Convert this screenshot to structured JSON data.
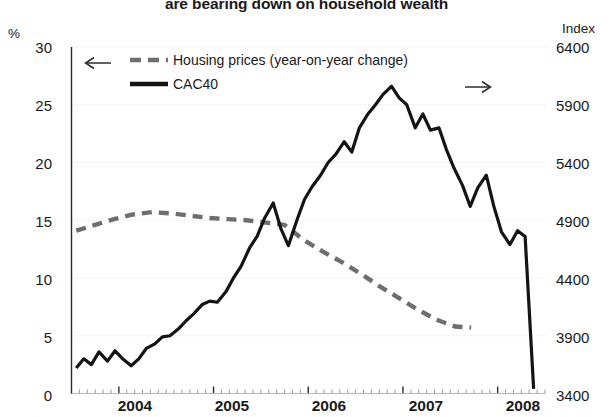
{
  "title": "are bearing down on household wealth",
  "axes": {
    "left_unit": "%",
    "right_unit": "Index",
    "left_ticks": [
      "30",
      "25",
      "20",
      "15",
      "10",
      "5",
      "0"
    ],
    "right_ticks": [
      "6400",
      "5900",
      "5400",
      "4900",
      "4400",
      "3900",
      "3400"
    ],
    "x_ticks": [
      "2004",
      "2005",
      "2006",
      "2007",
      "2008"
    ]
  },
  "legend": {
    "housing_label": "Housing prices (year-on-year change)",
    "housing_arrow": "left-arrow",
    "cac_label": "CAC40",
    "cac_arrow": "right-arrow"
  },
  "colors": {
    "housing": "#6e6e6e",
    "cac40": "#141414",
    "grid": "#e8e8e8",
    "axis": "#2b2b2b",
    "text": "#1a1a1a"
  },
  "chart_data": {
    "type": "line",
    "title": "are bearing down on household wealth",
    "xlabel": "",
    "ylabel": "%",
    "y2label": "Index",
    "ylim": [
      0,
      30
    ],
    "y2lim": [
      3400,
      6400
    ],
    "xlim": [
      2003.5,
      2008.5
    ],
    "grid": true,
    "legend_position": "top-left",
    "yticks": [
      0,
      5,
      10,
      15,
      20,
      25,
      30
    ],
    "y2ticks": [
      3400,
      3900,
      4400,
      4900,
      5400,
      5900,
      6400
    ],
    "xticks": [
      2004,
      2005,
      2006,
      2007,
      2008
    ],
    "series": [
      {
        "name": "Housing prices (year-on-year change)",
        "axis": "left",
        "unit": "%",
        "style": "dashed",
        "color": "#6e6e6e",
        "x": [
          2003.55,
          2003.75,
          2003.95,
          2004.15,
          2004.35,
          2004.55,
          2004.75,
          2004.95,
          2005.15,
          2005.35,
          2005.55,
          2005.75,
          2005.95,
          2006.15,
          2006.35,
          2006.55,
          2006.75,
          2006.95,
          2007.15,
          2007.35,
          2007.55,
          2007.72
        ],
        "values": [
          14.1,
          14.6,
          15.1,
          15.5,
          15.7,
          15.6,
          15.4,
          15.2,
          15.1,
          15.0,
          14.8,
          14.6,
          13.3,
          12.3,
          11.4,
          10.4,
          9.3,
          8.3,
          7.3,
          6.4,
          5.8,
          5.7
        ]
      },
      {
        "name": "CAC40",
        "axis": "right",
        "unit": "Index",
        "style": "solid",
        "color": "#141414",
        "x": [
          2003.55,
          2003.63,
          2003.71,
          2003.79,
          2003.88,
          2003.96,
          2004.04,
          2004.13,
          2004.21,
          2004.29,
          2004.38,
          2004.46,
          2004.54,
          2004.63,
          2004.71,
          2004.79,
          2004.88,
          2004.96,
          2005.04,
          2005.13,
          2005.21,
          2005.29,
          2005.38,
          2005.46,
          2005.54,
          2005.63,
          2005.71,
          2005.79,
          2005.88,
          2005.96,
          2006.04,
          2006.13,
          2006.21,
          2006.29,
          2006.38,
          2006.46,
          2006.54,
          2006.63,
          2006.71,
          2006.79,
          2006.88,
          2006.96,
          2007.04,
          2007.13,
          2007.21,
          2007.29,
          2007.38,
          2007.46,
          2007.54,
          2007.63,
          2007.71,
          2007.79,
          2007.88,
          2007.96,
          2008.04,
          2008.13,
          2008.21,
          2008.29,
          2008.38
        ],
        "values": [
          3620,
          3700,
          3650,
          3760,
          3680,
          3770,
          3700,
          3640,
          3700,
          3790,
          3830,
          3890,
          3900,
          3960,
          4030,
          4090,
          4170,
          4200,
          4190,
          4280,
          4400,
          4500,
          4660,
          4760,
          4920,
          5050,
          4830,
          4680,
          4900,
          5080,
          5190,
          5290,
          5400,
          5470,
          5580,
          5490,
          5700,
          5820,
          5900,
          5990,
          6060,
          5960,
          5900,
          5700,
          5820,
          5680,
          5700,
          5510,
          5350,
          5200,
          5020,
          5180,
          5290,
          5020,
          4800,
          4690,
          4810,
          4760,
          3440
        ]
      }
    ]
  }
}
